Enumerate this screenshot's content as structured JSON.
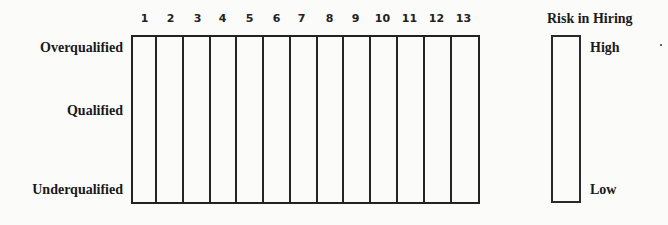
{
  "diagram": {
    "columns": {
      "labels": [
        "1",
        "2",
        "3",
        "4",
        "5",
        "6",
        "7",
        "8",
        "9",
        "10",
        "11",
        "12",
        "13"
      ]
    },
    "rows": {
      "top": "Overqualified",
      "middle": "Qualified",
      "bottom": "Underqualified"
    },
    "risk_scale": {
      "title": "Risk in Hiring",
      "high": "High",
      "low": "Low"
    }
  }
}
